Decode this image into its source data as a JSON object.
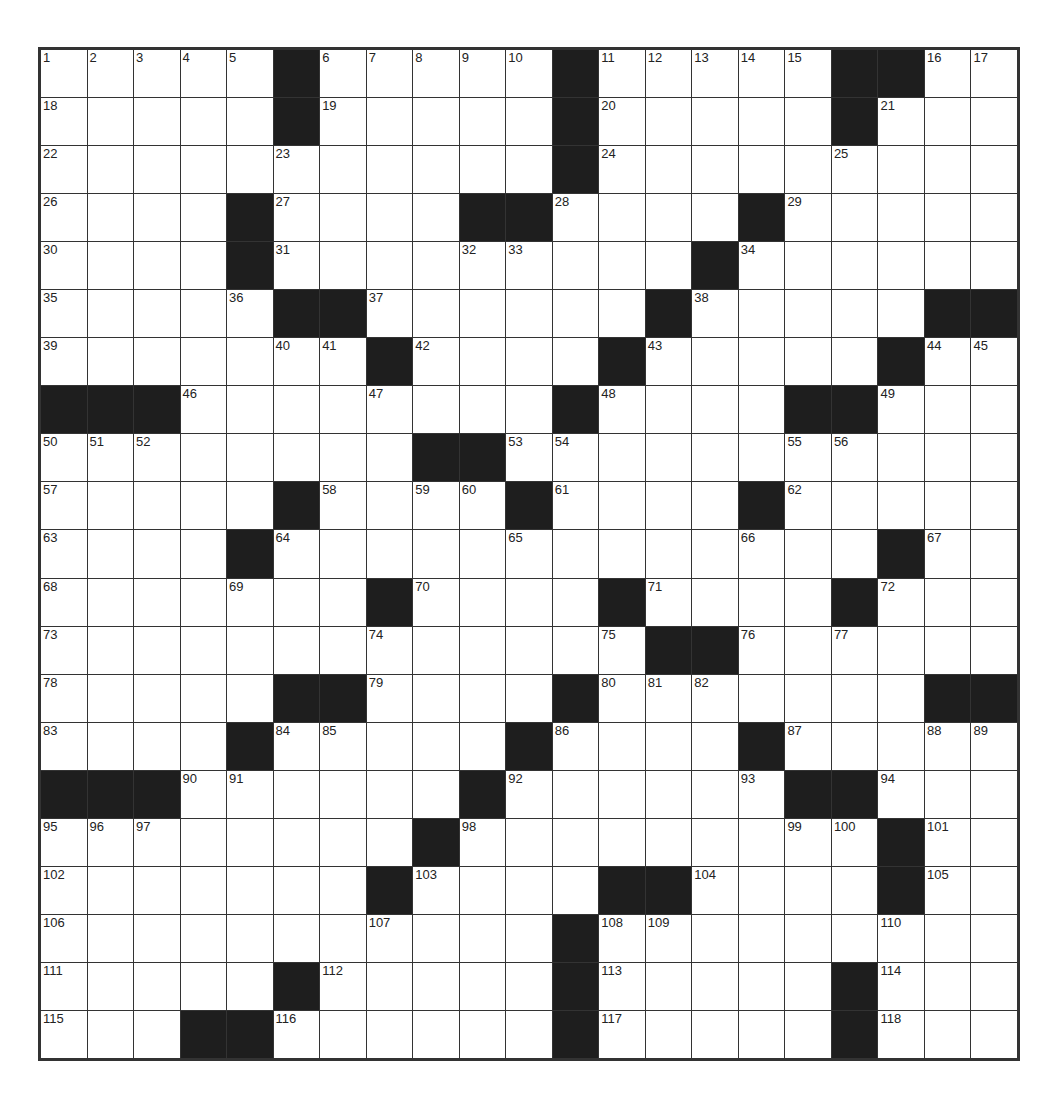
{
  "puzzle": {
    "size": {
      "rows": 21,
      "cols": 21
    },
    "colors": {
      "black": "#1e1e1e",
      "white": "#ffffff",
      "border": "#333333",
      "number": "#222222"
    },
    "grid": [
      ".....#.....#.....##...",
      ".....#.....#.....#...",
      "...........#.........",
      "....#....##.....#.....",
      "....#.........#......",
      ".....##.......#.....##",
      ".......#....#.....#...",
      "###........#....##...",
      "........##...........",
      ".....#....#....#.....",
      "....#.............#..",
      ".......#....#....#...",
      ".............##......",
      ".....##....#.......##",
      "....#.....#....#.....",
      "###......#......##...",
      "........#.........#..",
      ".......#....##.....#.",
      "...........#.........",
      ".....#.....#.....#...",
      "...##......#.....#..."
    ]
  }
}
